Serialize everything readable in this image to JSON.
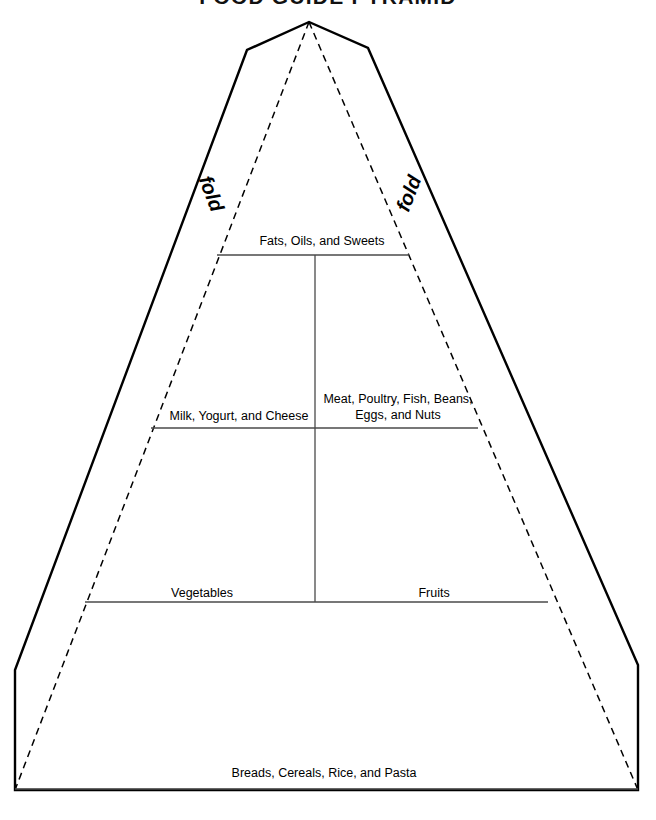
{
  "title": "FOOD GUIDE PYRAMID",
  "fold_labels": {
    "left": "fold",
    "right": "fold"
  },
  "tiers": [
    {
      "id": "tier-fats",
      "label": "Fats, Oils, and Sweets",
      "lines": [
        "Fats, Oils, and Sweets"
      ]
    },
    {
      "id": "tier-milk",
      "label": "Milk, Yogurt, and Cheese",
      "lines": [
        "Milk, Yogurt, and Cheese"
      ]
    },
    {
      "id": "tier-meat",
      "label": "Meat, Poultry, Fish, Beans, Eggs, and Nuts",
      "lines": [
        "Meat, Poultry, Fish, Beans,",
        "Eggs, and Nuts"
      ]
    },
    {
      "id": "tier-vegetables",
      "label": "Vegetables",
      "lines": [
        "Vegetables"
      ]
    },
    {
      "id": "tier-fruits",
      "label": "Fruits",
      "lines": [
        "Fruits"
      ]
    },
    {
      "id": "tier-breads",
      "label": "Breads, Cereals, Rice, and Pasta",
      "lines": [
        "Breads, Cereals, Rice, and Pasta"
      ]
    }
  ],
  "colors": {
    "outline": "#000000",
    "fold": "#000000",
    "divider": "#4a4a4a",
    "background": "#ffffff",
    "text": "#000000"
  }
}
